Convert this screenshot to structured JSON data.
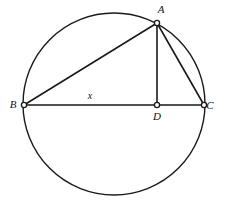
{
  "figure": {
    "background_color": "#ffffff",
    "stroke_color": "#1a1a1a",
    "label_color": "#111111"
  },
  "circle": {
    "name": "circumscribed-circle",
    "center_x": 114,
    "center_y": 104,
    "radius": 91
  },
  "points": [
    {
      "id": "A",
      "label": "A",
      "x": 157,
      "y": 23,
      "label_x": 161,
      "label_y": 10
    },
    {
      "id": "B",
      "label": "B",
      "x": 24,
      "y": 105,
      "label_x": 13,
      "label_y": 105
    },
    {
      "id": "C",
      "label": "C",
      "x": 204,
      "y": 105,
      "label_x": 210,
      "label_y": 106
    },
    {
      "id": "D",
      "label": "D",
      "x": 157,
      "y": 105,
      "label_x": 157,
      "label_y": 117
    }
  ],
  "segments": [
    {
      "id": "BC",
      "from": "B",
      "to": "C",
      "x1": 24,
      "y1": 105,
      "x2": 204,
      "y2": 105
    },
    {
      "id": "BA",
      "from": "B",
      "to": "A",
      "x1": 24,
      "y1": 105,
      "x2": 157,
      "y2": 23
    },
    {
      "id": "AC",
      "from": "A",
      "to": "C",
      "x1": 157,
      "y1": 23,
      "x2": 204,
      "y2": 105
    },
    {
      "id": "AD",
      "from": "A",
      "to": "D",
      "x1": 157,
      "y1": 23,
      "x2": 157,
      "y2": 105
    }
  ],
  "measure_labels": [
    {
      "id": "x",
      "text": "x",
      "x": 90,
      "y": 97,
      "segment": "BD"
    }
  ]
}
